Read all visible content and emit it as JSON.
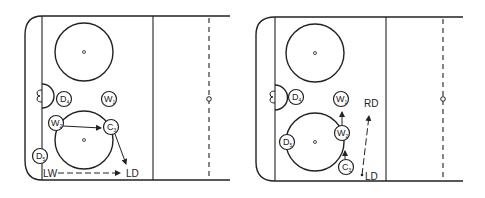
{
  "diagrams": [
    {
      "id": "left",
      "players": [
        {
          "letter": "D",
          "sub": "4"
        },
        {
          "letter": "W",
          "sub": "1"
        },
        {
          "letter": "W",
          "sub": "2"
        },
        {
          "letter": "C",
          "sub": "3"
        },
        {
          "letter": "D",
          "sub": "5"
        }
      ],
      "labels": {
        "start": "LW",
        "end": "LD"
      }
    },
    {
      "id": "right",
      "players": [
        {
          "letter": "D",
          "sub": "4"
        },
        {
          "letter": "W",
          "sub": "1"
        },
        {
          "letter": "W",
          "sub": "2"
        },
        {
          "letter": "D",
          "sub": "5"
        },
        {
          "letter": "C",
          "sub": "3"
        }
      ],
      "labels": {
        "top": "RD",
        "bottom": "LD"
      }
    }
  ],
  "colors": {
    "line": "#222222",
    "background": "#ffffff"
  }
}
